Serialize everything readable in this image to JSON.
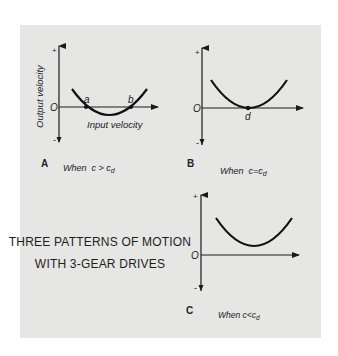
{
  "title": {
    "line1": "THREE PATTERNS OF MOTION",
    "line2": "WITH 3-GEAR DRIVES"
  },
  "colors": {
    "background": "#ffffff",
    "panel": "#e6e6e4",
    "ink": "#1a1a1a"
  },
  "panels": [
    {
      "id": "A",
      "letter": "A",
      "condition": "When  c > c",
      "condition_sub": "d",
      "y_axis_label": "Output velocity",
      "x_axis_label": "Input velocity",
      "origin_label": "O",
      "plus_label": "+",
      "minus_label": "-",
      "points": [
        {
          "name": "a",
          "label": "a"
        },
        {
          "name": "b",
          "label": "b"
        }
      ],
      "description": "Parabola crosses the input-velocity axis at two points a and b; output velocity is negative between them"
    },
    {
      "id": "B",
      "letter": "B",
      "condition": "When  c=c",
      "condition_sub": "d",
      "origin_label": "O",
      "plus_label": "+",
      "minus_label": "-",
      "points": [
        {
          "name": "d",
          "label": "d"
        }
      ],
      "description": "Parabola is tangent to the axis at point d; output velocity momentarily zero"
    },
    {
      "id": "C",
      "letter": "C",
      "condition": "When c<c",
      "condition_sub": "d",
      "origin_label": "O",
      "plus_label": "+",
      "minus_label": "-",
      "points": [],
      "description": "Parabola stays entirely above the axis; output velocity always positive"
    }
  ]
}
